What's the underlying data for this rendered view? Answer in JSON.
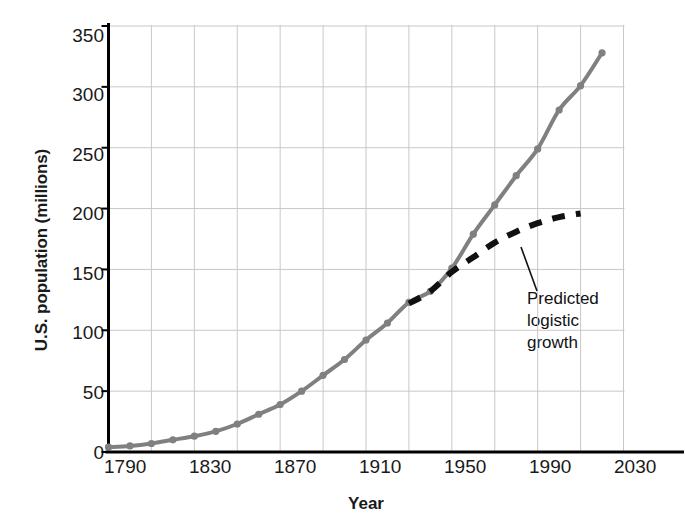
{
  "chart_data": {
    "type": "line",
    "title": "",
    "xlabel": "Year",
    "ylabel": "U.S. population (millions)",
    "xlim": [
      1790,
      2030
    ],
    "ylim": [
      0,
      350
    ],
    "grid": true,
    "grid_x_step": 20,
    "grid_y_step": 50,
    "legend_position": "none",
    "xticks": [
      1790,
      1830,
      1870,
      1910,
      1950,
      1990,
      2030
    ],
    "xtick_labels": [
      "1790",
      "1830",
      "1870",
      "1910",
      "1950",
      "1990",
      "2030"
    ],
    "yticks": [
      0,
      50,
      100,
      150,
      200,
      250,
      300,
      350
    ],
    "ytick_labels": [
      "0",
      "50",
      "100",
      "150",
      "200",
      "250",
      "300",
      "350"
    ],
    "series": [
      {
        "name": "U.S. population (observed)",
        "style": "solid-with-markers",
        "color": "#808080",
        "x": [
          1790,
          1800,
          1810,
          1820,
          1830,
          1840,
          1850,
          1860,
          1870,
          1880,
          1890,
          1900,
          1910,
          1920,
          1930,
          1940,
          1950,
          1960,
          1970,
          1980,
          1990,
          2000,
          2010,
          2020
        ],
        "values": [
          4,
          5,
          7,
          10,
          13,
          17,
          23,
          31,
          39,
          50,
          63,
          76,
          92,
          106,
          123,
          132,
          151,
          179,
          203,
          227,
          249,
          281,
          301,
          328
        ]
      },
      {
        "name": "Predicted logistic growth",
        "style": "dashed",
        "color": "#111111",
        "x": [
          1930,
          1940,
          1950,
          1960,
          1970,
          1980,
          1990,
          2000,
          2010
        ],
        "values": [
          122,
          132,
          148,
          160,
          172,
          181,
          188,
          193,
          196
        ]
      }
    ],
    "annotations": [
      {
        "text": "Predicted logistic growth",
        "lines": [
          "Predicted",
          "logistic",
          "growth"
        ],
        "points_to_series": "Predicted logistic growth"
      }
    ]
  },
  "axis": {
    "x_label": "Year",
    "y_label": "U.S. population (millions)"
  },
  "colors": {
    "data_line": "#808080",
    "predicted_line": "#111111",
    "grid": "#c8c8c8",
    "axis": "#000000",
    "text": "#1a1a1a"
  }
}
